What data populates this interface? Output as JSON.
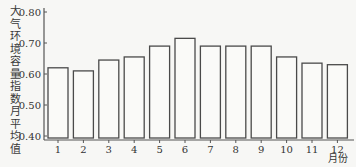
{
  "chart_data": {
    "type": "bar",
    "title": "",
    "xlabel": "月份",
    "ylabel": "大气环境容量指数月平均值",
    "categories": [
      "1",
      "2",
      "3",
      "4",
      "5",
      "6",
      "7",
      "8",
      "9",
      "10",
      "11",
      "12"
    ],
    "values": [
      0.62,
      0.61,
      0.645,
      0.655,
      0.69,
      0.715,
      0.69,
      0.69,
      0.69,
      0.655,
      0.635,
      0.63
    ],
    "ylim": [
      0.4,
      0.8
    ],
    "yticks": [
      "0.40",
      "0.50",
      "0.60",
      "0.70",
      "0.80"
    ],
    "grid": false,
    "legend": null,
    "bar_style": "hollow outlined bars"
  },
  "colors": {
    "axis": "#555555",
    "bar_outline": "#4a4a4a",
    "bar_fill": "#fafaf8",
    "text": "#333333"
  }
}
